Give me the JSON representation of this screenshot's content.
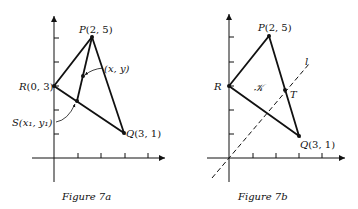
{
  "figures": [
    {
      "caption": "Figure 7a",
      "points": {
        "P": {
          "label": "P",
          "coords": "(2, 5)"
        },
        "R": {
          "label": "R",
          "coords": "(0, 3)"
        },
        "Q": {
          "label": "Q",
          "coords": "(3, 1)"
        },
        "XY": {
          "label": "(x, y)"
        },
        "S": {
          "label": "S",
          "coords": "(x₁, y₁)"
        }
      }
    },
    {
      "caption": "Figure 7b",
      "points": {
        "P": {
          "label": "P",
          "coords": "(2, 5)"
        },
        "R": {
          "label": "R"
        },
        "Q": {
          "label": "Q",
          "coords": "(3, 1)"
        },
        "T": {
          "label": "T"
        }
      },
      "region_label": "𝒦",
      "line_label": "l"
    }
  ],
  "colors": {
    "ink": "#111111",
    "background": "#ffffff"
  }
}
